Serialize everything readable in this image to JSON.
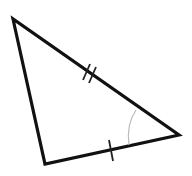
{
  "diagram": {
    "type": "triangle",
    "vertices": {
      "top_left": [
        13,
        19
      ],
      "bottom_left": [
        45,
        164
      ],
      "right": [
        179,
        135
      ]
    },
    "stroke_color": "#111111",
    "arc_color": "#bbbbbb",
    "marks": {
      "top_to_right_side": "double-tick",
      "bottom_to_right_side": "single-tick",
      "right_vertex": "angle-arc"
    }
  }
}
